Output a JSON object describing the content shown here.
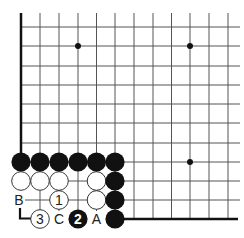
{
  "diagram": {
    "type": "go-board-fragment",
    "grid": {
      "x_lines": [
        21,
        40,
        59,
        78,
        96.5,
        115,
        134,
        153,
        171.5,
        190,
        209,
        228
      ],
      "y_lines": [
        27,
        46,
        66,
        85,
        104,
        123,
        143,
        162,
        181,
        200,
        219
      ],
      "top": 13,
      "right": 240,
      "line_color": "#555555",
      "edge_color": "#111111"
    },
    "star_points": [
      [
        78,
        46
      ],
      [
        190,
        46
      ],
      [
        190,
        162
      ]
    ],
    "black_stones": [
      {
        "x": 21,
        "y": 162,
        "label": ""
      },
      {
        "x": 40,
        "y": 162,
        "label": ""
      },
      {
        "x": 59,
        "y": 162,
        "label": ""
      },
      {
        "x": 78,
        "y": 162,
        "label": ""
      },
      {
        "x": 96.5,
        "y": 162,
        "label": ""
      },
      {
        "x": 115,
        "y": 162,
        "label": ""
      },
      {
        "x": 115,
        "y": 181,
        "label": ""
      },
      {
        "x": 115,
        "y": 200,
        "label": ""
      },
      {
        "x": 115,
        "y": 219,
        "label": ""
      },
      {
        "x": 78,
        "y": 219,
        "label": "2"
      }
    ],
    "white_stones": [
      {
        "x": 21,
        "y": 181,
        "label": ""
      },
      {
        "x": 40,
        "y": 181,
        "label": ""
      },
      {
        "x": 59,
        "y": 181,
        "label": ""
      },
      {
        "x": 96.5,
        "y": 181,
        "label": ""
      },
      {
        "x": 59,
        "y": 200,
        "label": "1"
      },
      {
        "x": 96.5,
        "y": 200,
        "label": ""
      },
      {
        "x": 40,
        "y": 219,
        "label": "3"
      }
    ],
    "letters": [
      {
        "text": "A",
        "x": 96.5,
        "y": 219
      },
      {
        "text": "B",
        "x": 19,
        "y": 200
      },
      {
        "text": "C",
        "x": 59,
        "y": 219
      }
    ]
  }
}
